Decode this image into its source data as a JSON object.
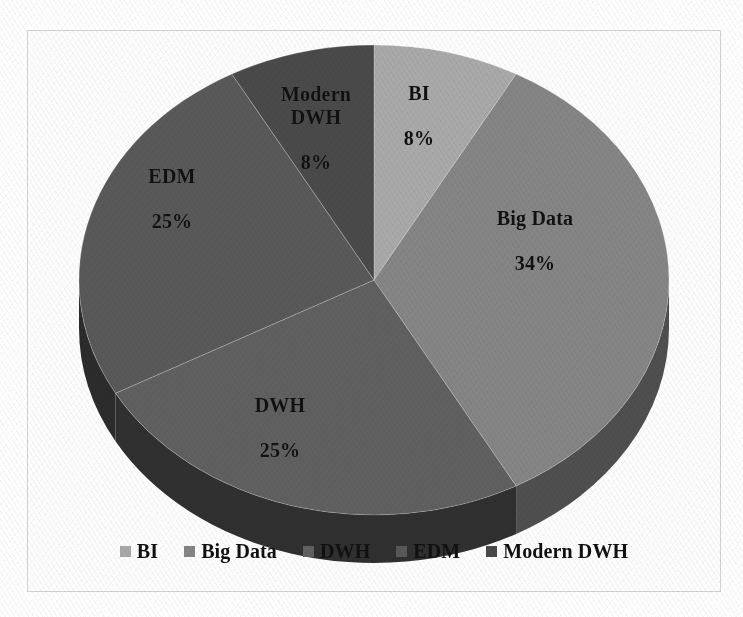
{
  "chart_data": {
    "type": "pie",
    "title": "",
    "subtitle": "",
    "xlabel": "",
    "ylabel": "",
    "grid": false,
    "three_d": true,
    "start_angle_deg": 0,
    "direction": "clockwise",
    "legend_position": "bottom",
    "categories": [
      "BI",
      "Big Data",
      "DWH",
      "EDM",
      "Modern DWH"
    ],
    "values": [
      8,
      34,
      25,
      25,
      8
    ],
    "value_unit": "%",
    "data_labels": [
      {
        "name": "BI",
        "percent": 8,
        "label_text": "BI",
        "percent_text": "8%"
      },
      {
        "name": "Big Data",
        "percent": 34,
        "label_text": "Big Data",
        "percent_text": "34%"
      },
      {
        "name": "DWH",
        "percent": 25,
        "label_text": "DWH",
        "percent_text": "25%"
      },
      {
        "name": "EDM",
        "percent": 25,
        "label_text": "EDM",
        "percent_text": "25%"
      },
      {
        "name": "Modern DWH",
        "percent": 8,
        "label_text": "Modern\nDWH",
        "percent_text": "8%"
      }
    ],
    "slice_colors": [
      "#a9a9a9",
      "#858585",
      "#606060",
      "#595959",
      "#4a4a4a"
    ],
    "slice_side_colors": [
      "#6f6f6f",
      "#4f4f4f",
      "#303030",
      "#2c2c2c",
      "#242424"
    ]
  },
  "legend": {
    "items": [
      {
        "label": "BI",
        "color": "#a9a9a9"
      },
      {
        "label": "Big Data",
        "color": "#858585"
      },
      {
        "label": "DWH",
        "color": "#606060"
      },
      {
        "label": "EDM",
        "color": "#595959"
      },
      {
        "label": "Modern DWH",
        "color": "#4a4a4a"
      }
    ]
  },
  "frame": {
    "border_color": "#d2d2d2",
    "background": "#fdfdfd"
  }
}
